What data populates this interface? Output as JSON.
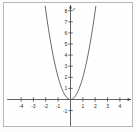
{
  "chart_data": {
    "type": "line",
    "title": "",
    "subtitle": "",
    "xlabel": "",
    "ylabel": "y",
    "xlim": [
      -5,
      5
    ],
    "ylim": [
      -1.6,
      8.4
    ],
    "grid": false,
    "legend": null,
    "legend_position": "none",
    "axis_arrows": true,
    "x_ticks": [
      -4,
      -3,
      -2,
      -1,
      1,
      2,
      3,
      4
    ],
    "x_tick_labels": [
      "-4",
      "-3",
      "-2",
      "-1",
      "1",
      "2",
      "3",
      "4"
    ],
    "y_ticks": [
      -1,
      1,
      2,
      3,
      4,
      5,
      6,
      7,
      8
    ],
    "y_tick_labels": [
      "-1",
      "1",
      "2",
      "3",
      "4",
      "5",
      "6",
      "7",
      "8"
    ],
    "series": [
      {
        "name": "y = 2x^2",
        "equation": "y = 2x^2",
        "color": "#5a5a5a",
        "vertex": [
          0,
          0
        ],
        "opens": "up",
        "x": [
          -2.05,
          -1.9,
          -1.8,
          -1.7,
          -1.6,
          -1.5,
          -1.4,
          -1.3,
          -1.2,
          -1.1,
          -1.0,
          -0.9,
          -0.8,
          -0.7,
          -0.6,
          -0.5,
          -0.4,
          -0.3,
          -0.2,
          -0.1,
          0,
          0.1,
          0.2,
          0.3,
          0.4,
          0.5,
          0.6,
          0.7,
          0.8,
          0.9,
          1.0,
          1.1,
          1.2,
          1.3,
          1.4,
          1.5,
          1.6,
          1.7,
          1.8,
          1.9,
          2.05
        ],
        "values": [
          8.4,
          7.22,
          6.48,
          5.78,
          5.12,
          4.5,
          3.92,
          3.38,
          2.88,
          2.42,
          2.0,
          1.62,
          1.28,
          0.98,
          0.72,
          0.5,
          0.32,
          0.18,
          0.08,
          0.02,
          0,
          0.02,
          0.08,
          0.18,
          0.32,
          0.5,
          0.72,
          0.98,
          1.28,
          1.62,
          2.0,
          2.42,
          2.88,
          3.38,
          3.92,
          4.5,
          5.12,
          5.78,
          6.48,
          7.22,
          8.4
        ]
      }
    ]
  },
  "axes": {
    "y_axis_label": "y"
  }
}
